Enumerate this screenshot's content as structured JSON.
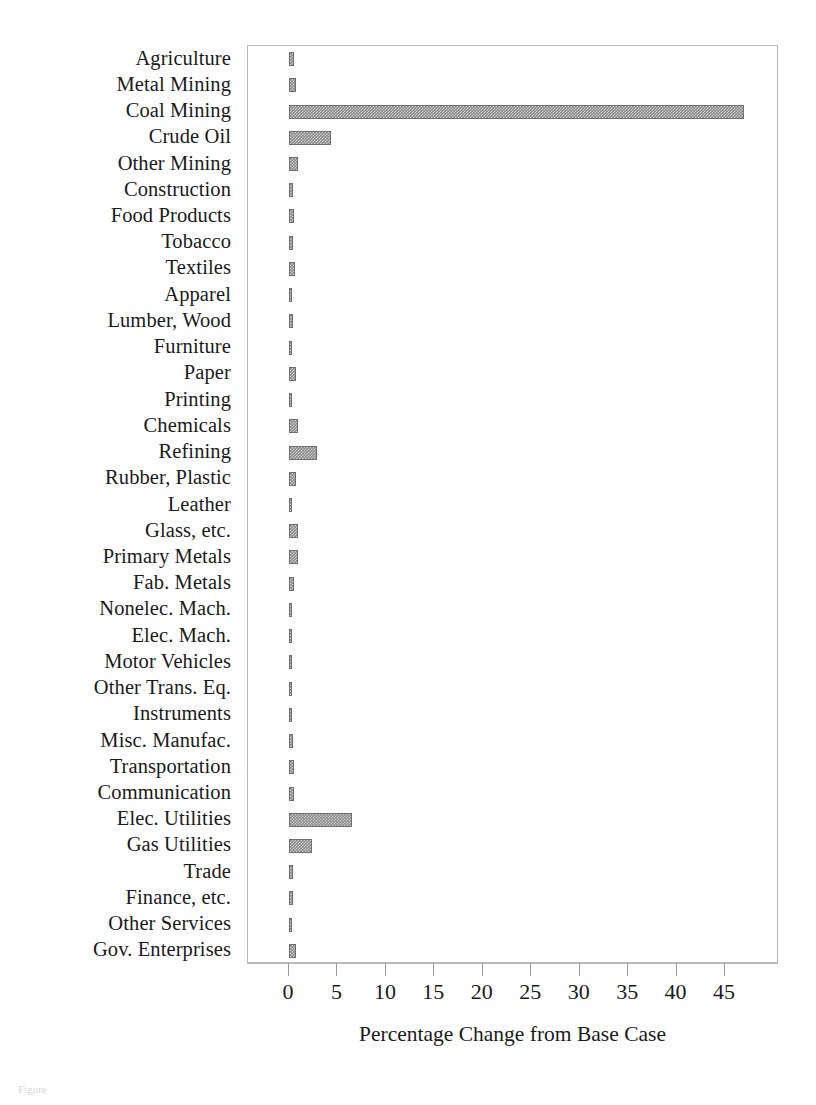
{
  "chart_data": {
    "type": "bar",
    "orientation": "horizontal",
    "title": "",
    "xlabel": "Percentage Change from Base Case",
    "ylabel": "",
    "xlim": [
      0,
      50
    ],
    "xticks": [
      0,
      5,
      10,
      15,
      20,
      25,
      30,
      35,
      40,
      45
    ],
    "xticklabels": [
      "0",
      "5",
      "10",
      "15",
      "20",
      "25",
      "30",
      "35",
      "40",
      "45"
    ],
    "grid": false,
    "legend": null,
    "bar_color": "#8a8a8a",
    "bar_edge_color": "#6f6f6f",
    "categories": [
      "Agriculture",
      "Metal Mining",
      "Coal Mining",
      "Crude Oil",
      "Other Mining",
      "Construction",
      "Food Products",
      "Tobacco",
      "Textiles",
      "Apparel",
      "Lumber, Wood",
      "Furniture",
      "Paper",
      "Printing",
      "Chemicals",
      "Refining",
      "Rubber, Plastic",
      "Leather",
      "Glass, etc.",
      "Primary Metals",
      "Fab. Metals",
      "Nonelec. Mach.",
      "Elec. Mach.",
      "Motor Vehicles",
      "Other Trans. Eq.",
      "Instruments",
      "Misc. Manufac.",
      "Transportation",
      "Communication",
      "Elec. Utilities",
      "Gas Utilities",
      "Trade",
      "Finance, etc.",
      "Other Services",
      "Gov. Enterprises"
    ],
    "values": [
      0.5,
      0.7,
      47.0,
      4.3,
      0.9,
      0.4,
      0.5,
      0.4,
      0.6,
      0.25,
      0.45,
      0.3,
      0.7,
      0.35,
      0.9,
      2.9,
      0.7,
      0.15,
      0.95,
      0.95,
      0.55,
      0.3,
      0.25,
      0.3,
      0.3,
      0.35,
      0.4,
      0.55,
      0.5,
      6.5,
      2.4,
      0.4,
      0.4,
      0.3,
      0.7
    ]
  },
  "caption": {
    "text": "Figure"
  }
}
